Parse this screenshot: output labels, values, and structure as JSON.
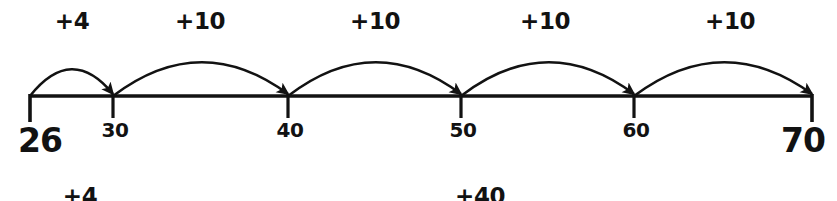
{
  "diagram": {
    "line_color": "#121212",
    "text_color": "#121212",
    "background": "#ffffff",
    "start_value": "26",
    "end_value": "70",
    "axis": {
      "x_start": 30,
      "x_end": 812,
      "y": 96
    },
    "ticks": [
      {
        "label": "26",
        "x": 30,
        "size": "large",
        "label_x": 40,
        "label_y": 124
      },
      {
        "label": "30",
        "x": 113,
        "size": "small",
        "label_x": 115,
        "label_y": 120
      },
      {
        "label": "40",
        "x": 288,
        "size": "small",
        "label_x": 290,
        "label_y": 120
      },
      {
        "label": "50",
        "x": 461,
        "size": "small",
        "label_x": 463,
        "label_y": 120
      },
      {
        "label": "60",
        "x": 634,
        "size": "small",
        "label_x": 636,
        "label_y": 120
      },
      {
        "label": "70",
        "x": 812,
        "size": "large",
        "label_x": 803,
        "label_y": 124
      }
    ],
    "jumps": [
      {
        "label": "+4",
        "from_x": 30,
        "to_x": 113,
        "peak_y": 55,
        "label_x": 72,
        "label_y": 10
      },
      {
        "label": "+10",
        "from_x": 113,
        "to_x": 288,
        "peak_y": 44,
        "label_x": 200,
        "label_y": 10
      },
      {
        "label": "+10",
        "from_x": 288,
        "to_x": 461,
        "peak_y": 44,
        "label_x": 375,
        "label_y": 10
      },
      {
        "label": "+10",
        "from_x": 461,
        "to_x": 634,
        "peak_y": 44,
        "label_x": 545,
        "label_y": 10
      },
      {
        "label": "+10",
        "from_x": 634,
        "to_x": 812,
        "peak_y": 44,
        "label_x": 730,
        "label_y": 10
      }
    ],
    "totals": [
      {
        "label": "+4",
        "label_x": 80,
        "label_y": 185
      },
      {
        "label": "+40",
        "label_x": 480,
        "label_y": 185
      }
    ]
  }
}
